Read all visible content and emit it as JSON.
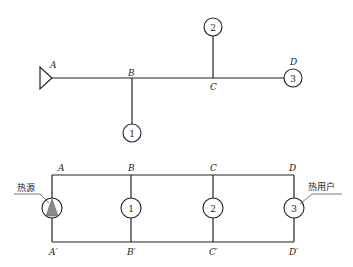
{
  "top_diagram": {
    "labels": {
      "A": "A",
      "B": "B",
      "C": "C",
      "D": "D"
    },
    "nodes": [
      {
        "id": "1",
        "label": "1"
      },
      {
        "id": "2",
        "label": "2"
      },
      {
        "id": "3",
        "label": "3"
      }
    ]
  },
  "bottom_diagram": {
    "labels": {
      "A": "A",
      "B": "B",
      "C": "C",
      "D": "D",
      "A_prime": "A′",
      "B_prime": "B′",
      "C_prime": "C′",
      "D_prime": "D′"
    },
    "nodes": [
      {
        "id": "1",
        "label": "1"
      },
      {
        "id": "2",
        "label": "2"
      },
      {
        "id": "3",
        "label": "3"
      }
    ],
    "heat_source_label": "热源",
    "heat_user_label": "热用户",
    "colors": {
      "heat_source_fill": "#8a8a8a"
    }
  }
}
